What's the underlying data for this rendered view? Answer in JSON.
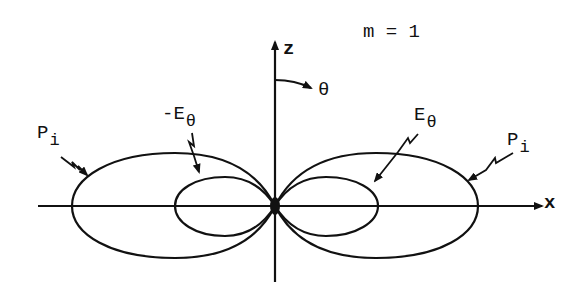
{
  "title": "m = 1",
  "axes": {
    "z_label": "z",
    "x_label": "x",
    "theta_label": "θ"
  },
  "labels": {
    "pi_left": {
      "main": "P",
      "sub": "i"
    },
    "pi_right": {
      "main": "P",
      "sub": "i"
    },
    "e_theta_neg": {
      "main": "-E",
      "sub": "θ"
    },
    "e_theta": {
      "main": "E",
      "sub": "θ"
    }
  },
  "colors": {
    "ink": "#111111",
    "background": "#ffffff"
  },
  "geometry": {
    "origin": [
      275,
      206
    ],
    "outer_lobe": {
      "half_width": 102,
      "half_height": 52
    },
    "inner_lobe": {
      "half_width": 51,
      "half_height": 30
    }
  }
}
